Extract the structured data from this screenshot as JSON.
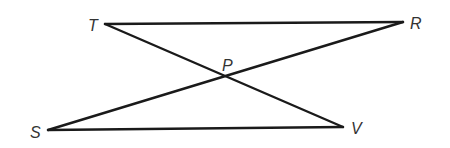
{
  "diagram": {
    "type": "geometry",
    "points": {
      "T": {
        "label": "T",
        "x": 105,
        "y": 24,
        "label_x": 88,
        "label_y": 31
      },
      "R": {
        "label": "R",
        "x": 403,
        "y": 22,
        "label_x": 410,
        "label_y": 29
      },
      "P": {
        "label": "P",
        "x": 227,
        "y": 84,
        "label_x": 222,
        "label_y": 71
      },
      "S": {
        "label": "S",
        "x": 48,
        "y": 130,
        "label_x": 30,
        "label_y": 138
      },
      "V": {
        "label": "V",
        "x": 343,
        "y": 127,
        "label_x": 351,
        "label_y": 134
      }
    },
    "segments": [
      {
        "name": "TR",
        "from": "T",
        "to": "R"
      },
      {
        "name": "TV",
        "from": "T",
        "to": "V"
      },
      {
        "name": "SR",
        "from": "S",
        "to": "R"
      },
      {
        "name": "SV",
        "from": "S",
        "to": "V"
      }
    ],
    "line_color": "#1a1a1a",
    "label_color": "#333333"
  }
}
